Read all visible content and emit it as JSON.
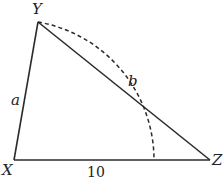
{
  "diagram": {
    "type": "triangle-with-arc",
    "vertices": {
      "X": {
        "label": "X",
        "x": 14,
        "y": 160
      },
      "Y": {
        "label": "Y",
        "x": 38,
        "y": 22
      },
      "Z": {
        "label": "Z",
        "x": 210,
        "y": 160
      }
    },
    "sides": {
      "XY": {
        "label": "a"
      },
      "XZ": {
        "label": "10"
      },
      "YZ": {
        "label": ""
      }
    },
    "arc": {
      "style": "dashed",
      "center": "X",
      "from": "Y",
      "to_base_x": 154,
      "label": "b"
    },
    "colors": {
      "stroke": "#2b2b2b",
      "text": "#222222"
    }
  }
}
